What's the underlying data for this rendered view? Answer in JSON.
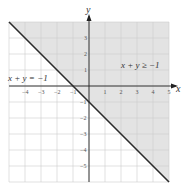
{
  "chart_data": {
    "type": "line",
    "title": "",
    "xlabel": "x",
    "ylabel": "y",
    "xlim": [
      -5,
      5
    ],
    "ylim": [
      -6,
      4
    ],
    "grid": true,
    "x_ticks": [
      "-4",
      "-3",
      "-2",
      "-1",
      "1",
      "2",
      "3",
      "4",
      "5"
    ],
    "y_ticks": [
      "3",
      "2",
      "1",
      "-1",
      "-2",
      "-3",
      "-4",
      "-5"
    ],
    "series": [
      {
        "name": "x + y = -1",
        "points": [
          [
            -5,
            4
          ],
          [
            5,
            -6
          ]
        ],
        "style": "solid boundary line"
      }
    ],
    "shaded_region": {
      "inequality": "x + y ≥ -1",
      "side": "above/right of line",
      "color": "#e3e3e3"
    },
    "annotations": [
      {
        "text": "x + y = −1",
        "position": "left, above x-axis"
      },
      {
        "text": "x + y ≥ −1",
        "position": "right, above x-axis"
      }
    ],
    "colors": {
      "shade": "#e3e3e3",
      "grid": "#cfcfcf",
      "line": "#2b2b2b",
      "axis": "#222222"
    }
  },
  "labels": {
    "x_axis": "x",
    "y_axis": "y",
    "boundary": "x + y = −1",
    "region": "x + y ≥ −1"
  }
}
